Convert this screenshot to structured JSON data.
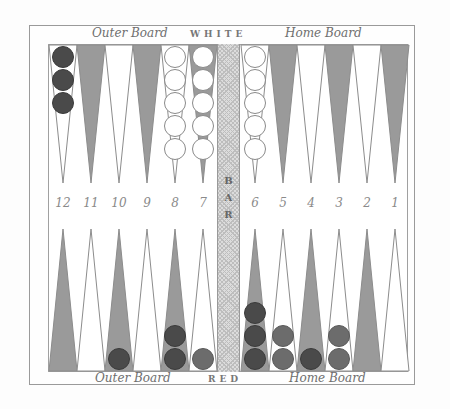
{
  "board": {
    "top_left_label": "Outer Board",
    "top_center_label": "WHITE",
    "top_right_label": "Home Board",
    "bottom_left_label": "Outer Board",
    "bottom_center_label": "RED",
    "bottom_right_label": "Home Board",
    "bar_label_letters": [
      "B",
      "A",
      "R"
    ],
    "colors": {
      "shaded_point": "#9a9a9a",
      "point_outline": "#8c8c8c",
      "white_checker": "#ffffff",
      "red_checker_dark": "#4a4a4a",
      "red_checker_light": "#6c6c6c"
    }
  },
  "point_numbers": [
    "12",
    "11",
    "10",
    "9",
    "8",
    "7",
    "6",
    "5",
    "4",
    "3",
    "2",
    "1"
  ],
  "top_points": [
    {
      "number": "12",
      "shaded": false,
      "checkers": [
        "red-dark",
        "red-dark",
        "red-dark"
      ]
    },
    {
      "number": "11",
      "shaded": true,
      "checkers": []
    },
    {
      "number": "10",
      "shaded": false,
      "checkers": []
    },
    {
      "number": "9",
      "shaded": true,
      "checkers": []
    },
    {
      "number": "8",
      "shaded": false,
      "checkers": [
        "white",
        "white",
        "white",
        "white",
        "white"
      ]
    },
    {
      "number": "7",
      "shaded": true,
      "checkers": [
        "white",
        "white",
        "white",
        "white",
        "white"
      ]
    },
    {
      "number": "6",
      "shaded": false,
      "checkers": [
        "white",
        "white",
        "white",
        "white",
        "white"
      ]
    },
    {
      "number": "5",
      "shaded": true,
      "checkers": []
    },
    {
      "number": "4",
      "shaded": false,
      "checkers": []
    },
    {
      "number": "3",
      "shaded": true,
      "checkers": []
    },
    {
      "number": "2",
      "shaded": false,
      "checkers": []
    },
    {
      "number": "1",
      "shaded": true,
      "checkers": []
    }
  ],
  "bottom_points": [
    {
      "position": "12",
      "shaded": true,
      "checkers": []
    },
    {
      "position": "11",
      "shaded": false,
      "checkers": []
    },
    {
      "position": "10",
      "shaded": true,
      "checkers": [
        "red-dark"
      ]
    },
    {
      "position": "9",
      "shaded": false,
      "checkers": []
    },
    {
      "position": "8",
      "shaded": true,
      "checkers": [
        "red-dark",
        "red-dark"
      ]
    },
    {
      "position": "7",
      "shaded": false,
      "checkers": [
        "red-light"
      ]
    },
    {
      "position": "6",
      "shaded": true,
      "checkers": [
        "red-dark",
        "red-dark",
        "red-dark"
      ]
    },
    {
      "position": "5",
      "shaded": false,
      "checkers": [
        "red-light",
        "red-light"
      ]
    },
    {
      "position": "4",
      "shaded": true,
      "checkers": [
        "red-dark"
      ]
    },
    {
      "position": "3",
      "shaded": false,
      "checkers": [
        "red-light",
        "red-light"
      ]
    },
    {
      "position": "2",
      "shaded": true,
      "checkers": []
    },
    {
      "position": "1",
      "shaded": false,
      "checkers": []
    }
  ]
}
